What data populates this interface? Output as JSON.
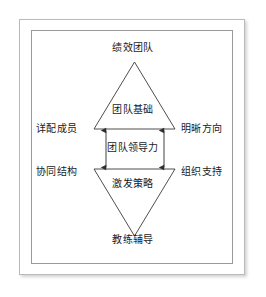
{
  "figure": {
    "title_top": "绩效团队",
    "title_bottom": "教练辅导",
    "core_label": "团队领导力",
    "upper_triangle_label": "团队基础",
    "lower_triangle_label": "激发策略",
    "left_upper_label": "详配成员",
    "right_upper_label": "明晰方向",
    "left_lower_label": "协同结构",
    "right_lower_label": "组织支持",
    "colors": {
      "line": "#3a3a3a",
      "text": "#1b1b1b",
      "outer_border": "#b9b9b9",
      "inner_border": "#9a9a9a",
      "background": "#ffffff"
    }
  }
}
